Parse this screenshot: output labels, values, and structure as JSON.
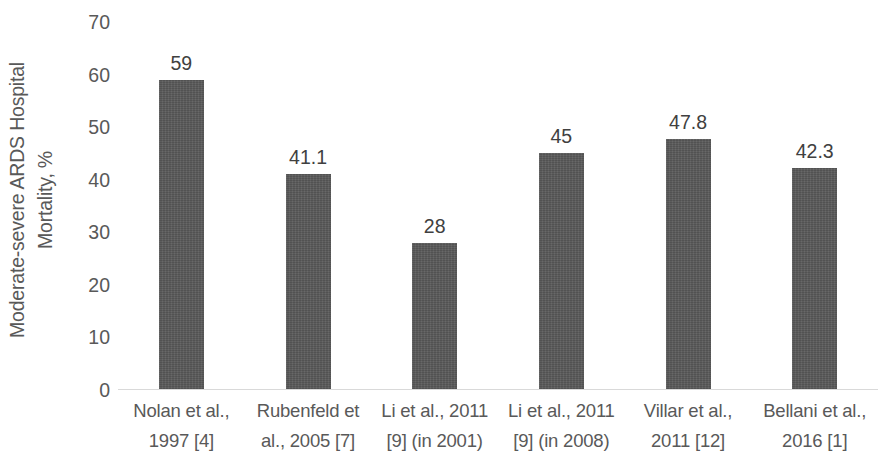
{
  "chart_data": {
    "type": "bar",
    "title": "",
    "subtitle": "",
    "xlabel": "",
    "ylabel": "Moderate-severe ARDS Hospital Mortality, %",
    "ylabel_lines": [
      "Moderate-severe ARDS Hospital",
      "Mortality, %"
    ],
    "ylim": [
      0,
      70
    ],
    "ytick_step": 10,
    "yticks": [
      "70",
      "60",
      "50",
      "40",
      "30",
      "20",
      "10",
      "0"
    ],
    "ytick_values": [
      70,
      60,
      50,
      40,
      30,
      20,
      10,
      0
    ],
    "grid": false,
    "legend": false,
    "legend_position": "none",
    "bar_color": "#595959",
    "categories": [
      "Nolan et al., 1997 [4]",
      "Rubenfeld et al., 2005 [7]",
      "Li et al., 2011 [9] (in 2001)",
      "Li et al., 2011 [9] (in 2008)",
      "Villar et al., 2011 [12]",
      "Bellani et al., 2016 [1]"
    ],
    "category_lines": [
      [
        "Nolan et al.,",
        "1997 [4]"
      ],
      [
        "Rubenfeld et",
        "al., 2005 [7]"
      ],
      [
        "Li et al., 2011",
        "[9] (in 2001)"
      ],
      [
        "Li et al., 2011",
        "[9] (in 2008)"
      ],
      [
        "Villar et al.,",
        "2011 [12]"
      ],
      [
        "Bellani et al.,",
        "2016 [1]"
      ]
    ],
    "values": [
      59,
      41.1,
      28,
      45,
      47.8,
      42.3
    ],
    "value_labels": [
      "59",
      "41.1",
      "28",
      "45",
      "47.8",
      "42.3"
    ]
  },
  "colors": {
    "bar": "#595959",
    "axis_text": "#595959",
    "data_label_text": "#404040",
    "baseline": "#d9d9d9",
    "background": "#ffffff"
  }
}
